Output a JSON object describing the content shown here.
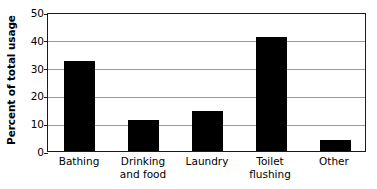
{
  "chart_data": {
    "type": "bar",
    "title": "",
    "subtitle": "",
    "xlabel": "",
    "ylabel": "Percent of total usage",
    "categories": [
      "Bathing",
      "Drinking and food",
      "Laundry",
      "Toilet flushing",
      "Other"
    ],
    "category_lines": [
      [
        "Bathing"
      ],
      [
        "Drinking",
        "and food"
      ],
      [
        "Laundry"
      ],
      [
        "Toilet",
        "flushing"
      ],
      [
        "Other"
      ]
    ],
    "values": [
      32.5,
      11,
      14.5,
      41,
      4
    ],
    "ylim": [
      0,
      50
    ],
    "yticks": [
      0,
      10,
      20,
      30,
      40,
      50
    ],
    "ytick_labels": [
      "0",
      "10",
      "20",
      "30",
      "40",
      "50"
    ],
    "grid": true,
    "grid_axis": "y",
    "legend": false,
    "legend_position": "none",
    "colors": {
      "bar": "#000000",
      "grid": "#9a9a9a",
      "frame": "#1a1a1a",
      "background": "#ffffff",
      "text": "#000000"
    }
  }
}
